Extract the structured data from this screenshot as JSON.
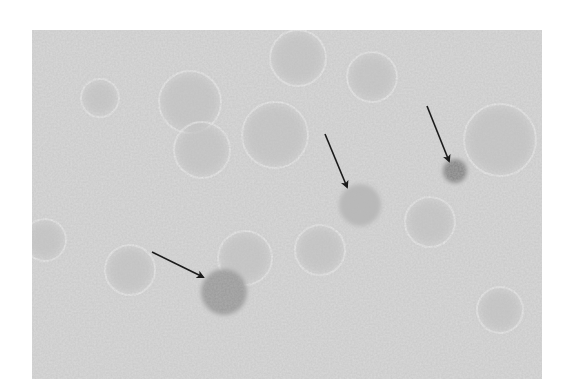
{
  "image": {
    "type": "micrograph",
    "description": "Grayscale light micrograph of cells; three cells with darker staining indicated by arrows",
    "frame": {
      "x": 32,
      "y": 30,
      "width": 510,
      "height": 349
    },
    "colors": {
      "page_background": "#ffffff",
      "field_background": "#d9d9d9",
      "cell_outline": "#eeeeee",
      "faint_cell": "#c6c6c6",
      "stained_cell_light": "#b8b8b8",
      "stained_cell_medium": "#9a9a9a",
      "stained_cell_dark": "#838383",
      "arrow": "#1a1a1a"
    },
    "faint_cells": [
      {
        "cx": 190,
        "cy": 102,
        "r": 28
      },
      {
        "cx": 275,
        "cy": 135,
        "r": 30
      },
      {
        "cx": 202,
        "cy": 150,
        "r": 25
      },
      {
        "cx": 372,
        "cy": 77,
        "r": 22
      },
      {
        "cx": 298,
        "cy": 58,
        "r": 25
      },
      {
        "cx": 500,
        "cy": 140,
        "r": 33
      },
      {
        "cx": 320,
        "cy": 250,
        "r": 22
      },
      {
        "cx": 245,
        "cy": 258,
        "r": 24
      },
      {
        "cx": 430,
        "cy": 222,
        "r": 22
      },
      {
        "cx": 100,
        "cy": 98,
        "r": 16
      },
      {
        "cx": 45,
        "cy": 240,
        "r": 18
      },
      {
        "cx": 130,
        "cy": 270,
        "r": 22
      },
      {
        "cx": 500,
        "cy": 310,
        "r": 20
      }
    ],
    "stained_cells": [
      {
        "id": "cell-1",
        "cx": 224,
        "cy": 292,
        "r": 23,
        "shade": "stained_cell_medium"
      },
      {
        "id": "cell-2",
        "cx": 360,
        "cy": 205,
        "r": 21,
        "shade": "stained_cell_light"
      },
      {
        "id": "cell-3",
        "cx": 455,
        "cy": 171,
        "r": 12,
        "shade": "stained_cell_dark"
      }
    ],
    "arrows": [
      {
        "id": "arrow-1",
        "x1": 152,
        "y1": 252,
        "x2": 203,
        "y2": 277
      },
      {
        "id": "arrow-2",
        "x1": 325,
        "y1": 134,
        "x2": 347,
        "y2": 187
      },
      {
        "id": "arrow-3",
        "x1": 427,
        "y1": 106,
        "x2": 449,
        "y2": 161
      }
    ]
  }
}
